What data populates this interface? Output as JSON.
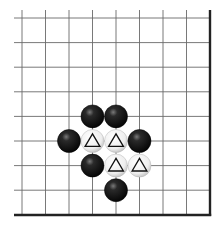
{
  "diagram": {
    "type": "go-board-corner",
    "corner": "bottom-right",
    "colors": {
      "background": "#ffffff",
      "grid_line": "#6a6a6a",
      "border_line": "#222222",
      "black_stone": "#1a1a1a",
      "white_stone": "#f2f2f2",
      "marker": "#111111"
    },
    "grid": {
      "x_lines": [
        22,
        45.5,
        69,
        92.5,
        116,
        139.5,
        163,
        186.5
      ],
      "y_lines": [
        18,
        42.6,
        67.2,
        91.8,
        116.4,
        141,
        165.6,
        190.2
      ],
      "right_border_x": 210,
      "bottom_border_y": 215,
      "left_extent": 14,
      "top_extent": 10
    },
    "stones": [
      {
        "color": "black",
        "col": 3,
        "row": 4,
        "marker": ""
      },
      {
        "color": "black",
        "col": 4,
        "row": 4,
        "marker": ""
      },
      {
        "color": "black",
        "col": 2,
        "row": 5,
        "marker": ""
      },
      {
        "color": "white",
        "col": 3,
        "row": 5,
        "marker": "triangle"
      },
      {
        "color": "white",
        "col": 4,
        "row": 5,
        "marker": "triangle"
      },
      {
        "color": "black",
        "col": 5,
        "row": 5,
        "marker": ""
      },
      {
        "color": "black",
        "col": 3,
        "row": 6,
        "marker": ""
      },
      {
        "color": "white",
        "col": 4,
        "row": 6,
        "marker": "triangle"
      },
      {
        "color": "white",
        "col": 5,
        "row": 6,
        "marker": "triangle"
      },
      {
        "color": "black",
        "col": 4,
        "row": 7,
        "marker": ""
      }
    ]
  }
}
